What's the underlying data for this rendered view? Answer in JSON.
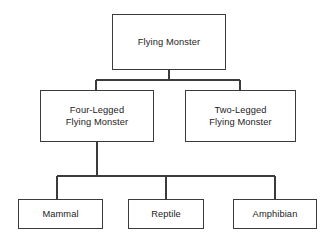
{
  "diagram": {
    "type": "hierarchy-tree",
    "background_color": "#ffffff",
    "box_border_color": "#3b3b3b",
    "connector_color": "#3b3b3b",
    "text_color": "#1c1c1c",
    "nodes": [
      {
        "id": "flying-monster",
        "label": "Flying Monster",
        "level": 0
      },
      {
        "id": "four-legged",
        "label": "Four-Legged\nFlying Monster",
        "level": 1
      },
      {
        "id": "two-legged",
        "label": "Two-Legged\nFlying Monster",
        "level": 1
      },
      {
        "id": "mammal",
        "label": "Mammal",
        "level": 2
      },
      {
        "id": "reptile",
        "label": "Reptile",
        "level": 2
      },
      {
        "id": "amphibian",
        "label": "Amphibian",
        "level": 2
      }
    ],
    "edges": [
      {
        "from": "flying-monster",
        "to": "four-legged"
      },
      {
        "from": "flying-monster",
        "to": "two-legged"
      },
      {
        "from": "four-legged",
        "to": "mammal"
      },
      {
        "from": "four-legged",
        "to": "reptile"
      },
      {
        "from": "four-legged",
        "to": "amphibian"
      }
    ]
  }
}
